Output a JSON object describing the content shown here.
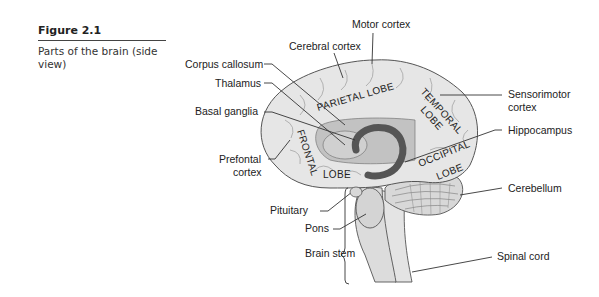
{
  "figure": {
    "number": "Figure 2.1",
    "title": "Parts of the brain (side view)"
  },
  "labels": {
    "motor_cortex": "Motor cortex",
    "cerebral_cortex": "Cerebral cortex",
    "corpus_callosum": "Corpus callosum",
    "thalamus": "Thalamus",
    "basal_ganglia": "Basal ganglia",
    "prefrontal_1": "Prefontal",
    "prefrontal_2": "cortex",
    "sensorimotor_1": "Sensorimotor",
    "sensorimotor_2": "cortex",
    "hippocampus": "Hippocampus",
    "cerebellum": "Cerebellum",
    "pituitary": "Pituitary",
    "pons": "Pons",
    "brain_stem": "Brain stem",
    "spinal_cord": "Spinal cord"
  },
  "lobes": {
    "parietal": "PARIETAL LOBE",
    "temporal_1": "TEMPORAL",
    "temporal_2": "LOBE",
    "occipital_1": "OCCIPITAL",
    "occipital_2": "LOBE",
    "frontal": "FRONTAL",
    "frontal_lobe": "LOBE"
  },
  "colors": {
    "brain_fill": "#e6e6e6",
    "inner_fill": "#b8b8b8",
    "dark_structure": "#555555",
    "outline": "#555555"
  }
}
